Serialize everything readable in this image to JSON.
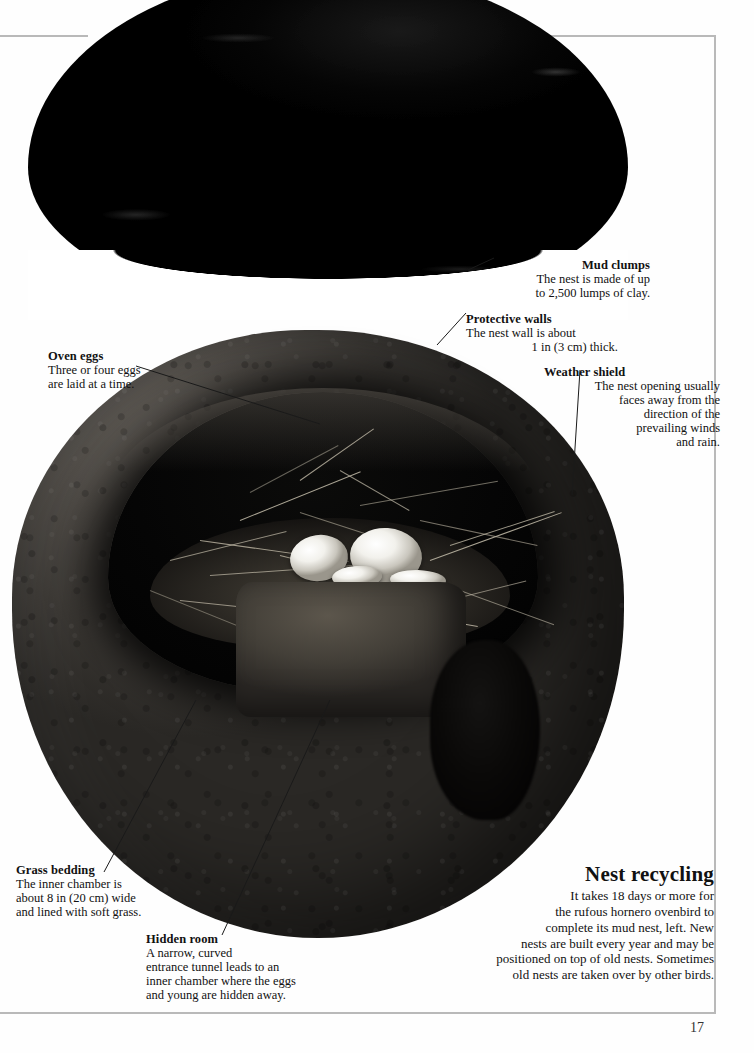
{
  "page": {
    "number": "17",
    "frame_color": "#b9b9b9"
  },
  "figure": {
    "upper_part_name": "nest-dome-cutaway",
    "lower_part_name": "nest-body-cross-section"
  },
  "annotations": [
    {
      "id": "mud-clumps",
      "heading": "Mud clumps",
      "body": "The nest is made of up to 2,500 lumps of clay.",
      "lines": [
        "The nest is made of up",
        "to 2,500 lumps of clay."
      ],
      "align": "right"
    },
    {
      "id": "protective-walls",
      "heading": "Protective walls",
      "body": "The nest wall is about 1 in (3 cm) thick.",
      "lines": [
        "The nest wall is about",
        "1 in (3 cm) thick."
      ],
      "align": "right"
    },
    {
      "id": "oven-eggs",
      "heading": "Oven eggs",
      "body": "Three or four eggs are laid at a time.",
      "lines": [
        "Three or four eggs",
        "are laid at a time."
      ],
      "align": "left"
    },
    {
      "id": "weather-shield",
      "heading": "Weather shield",
      "body": "The nest opening usually faces away from the direction of the prevailing winds and rain.",
      "lines": [
        "The nest opening usually",
        "faces away from the",
        "direction of the",
        "prevailing winds",
        "and rain."
      ],
      "align": "right"
    },
    {
      "id": "grass-bedding",
      "heading": "Grass bedding",
      "body": "The inner chamber is about 8 in (20 cm) wide and lined with soft grass.",
      "lines": [
        "The inner chamber is",
        "about 8 in (20 cm) wide",
        "and lined with soft grass."
      ],
      "align": "left"
    },
    {
      "id": "hidden-room",
      "heading": "Hidden room",
      "body": "A narrow, curved entrance tunnel leads to an inner chamber where the eggs and young are hidden away.",
      "lines": [
        "A narrow, curved",
        "entrance tunnel leads to an",
        "inner chamber where the eggs",
        "and young are hidden away."
      ],
      "align": "left"
    }
  ],
  "sidebar_box": {
    "heading": "Nest recycling",
    "body": "It takes 18 days or more for the rufous hornero ovenbird to complete its mud nest, left. New nests are built every year and may be positioned on top of old nests. Sometimes old nests are taken over by other birds.",
    "lines": [
      "It takes 18 days or more for",
      "the rufous hornero ovenbird to",
      "complete its mud nest, left. New",
      "nests are built every year and may be",
      "positioned on top of old nests. Sometimes",
      "old nests are taken over by other birds."
    ]
  }
}
